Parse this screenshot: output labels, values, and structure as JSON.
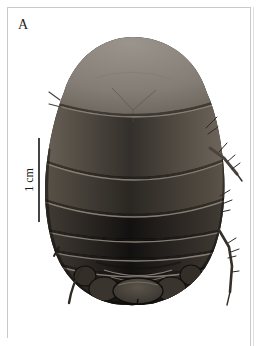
{
  "figure": {
    "panel_label": "A",
    "scale_bar_label": "1 cm",
    "image_alt": "Dorsal view photograph of a large dark oval segmented insect specimen (burrowing cockroach) with spiny legs, on a white background",
    "colors": {
      "background": "#ffffff",
      "frame": "#c9c9c9",
      "label_text": "#1f1d1b",
      "scale_bar": "#161616",
      "body_base": "#211e1a",
      "dome_light": "#9a948c",
      "segment_line": "#8e867b"
    }
  }
}
